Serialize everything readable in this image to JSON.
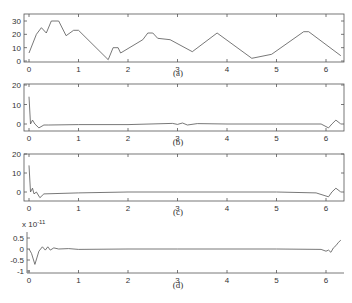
{
  "chart_data": [
    {
      "type": "line",
      "panel": "a",
      "caption": "(a)",
      "xlim": [
        0,
        6.3
      ],
      "ylim": [
        -2,
        35
      ],
      "xticks": [
        0,
        1,
        2,
        3,
        4,
        5,
        6
      ],
      "yticks": [
        0,
        10,
        20,
        30
      ],
      "x": [
        0,
        0.15,
        0.25,
        0.35,
        0.45,
        0.6,
        0.75,
        0.9,
        1.0,
        1.6,
        1.7,
        1.8,
        1.85,
        2.3,
        2.4,
        2.5,
        2.6,
        2.85,
        3.3,
        3.8,
        4.5,
        4.9,
        5.55,
        5.65,
        6.3
      ],
      "values": [
        6,
        20,
        25,
        21,
        30,
        30,
        19,
        23,
        23,
        1,
        10,
        10,
        6,
        16,
        21,
        21,
        17,
        16,
        7,
        21,
        2,
        5,
        22,
        22,
        4
      ],
      "grid": false,
      "box": true
    },
    {
      "type": "line",
      "panel": "b",
      "caption": "(b)",
      "xlim": [
        0,
        6.3
      ],
      "ylim": [
        -5,
        20
      ],
      "xticks": [
        0,
        1,
        2,
        3,
        4,
        5,
        6
      ],
      "yticks": [
        0,
        10,
        20
      ],
      "x": [
        0,
        0.03,
        0.07,
        0.12,
        0.2,
        0.3,
        0.4,
        1,
        2,
        2.9,
        3.0,
        3.1,
        3.2,
        3.4,
        4,
        5,
        5.9,
        6.05,
        6.12,
        6.2,
        6.3
      ],
      "values": [
        14,
        0,
        2,
        0,
        -2,
        -0.5,
        -0.5,
        -0.3,
        -0.3,
        0.3,
        -0.2,
        0.5,
        -0.5,
        0.2,
        0,
        0,
        0,
        -2,
        0,
        2,
        0
      ],
      "grid": false,
      "box": true
    },
    {
      "type": "line",
      "panel": "c",
      "caption": "(c)",
      "xlim": [
        0,
        6.3
      ],
      "ylim": [
        -5,
        20
      ],
      "xticks": [
        0,
        1,
        2,
        3,
        4,
        5,
        6
      ],
      "yticks": [
        0,
        10,
        20
      ],
      "x": [
        0,
        0.03,
        0.07,
        0.1,
        0.15,
        0.22,
        0.3,
        1,
        2,
        3,
        4,
        5,
        5.8,
        6.05,
        6.12,
        6.2,
        6.3
      ],
      "values": [
        14,
        0,
        2,
        -1,
        0,
        -3,
        -1,
        -0.5,
        0,
        0,
        0,
        0,
        -0.5,
        -2.5,
        0,
        2,
        0
      ],
      "grid": false,
      "box": true
    },
    {
      "type": "line",
      "panel": "d",
      "caption": "(d)",
      "y_multiplier": "x 10^-11",
      "xlim": [
        0,
        6.3
      ],
      "ylim": [
        -1,
        1
      ],
      "xticks": [
        0,
        1,
        2,
        3,
        4,
        5,
        6
      ],
      "yticks": [
        -1,
        -0.5,
        0,
        0.5
      ],
      "x": [
        0,
        0.05,
        0.12,
        0.2,
        0.27,
        0.33,
        0.38,
        0.43,
        0.5,
        0.6,
        0.8,
        1.0,
        2,
        3,
        4,
        5,
        5.9,
        6.0,
        6.05,
        6.1,
        6.15,
        6.2,
        6.25,
        6.3
      ],
      "values": [
        0,
        -0.2,
        -0.7,
        -0.1,
        0.1,
        -0.05,
        0.1,
        -0.05,
        0.05,
        0,
        0.02,
        -0.02,
        0,
        0,
        0,
        0,
        -0.02,
        -0.1,
        -0.05,
        -0.15,
        0.05,
        0.15,
        0.3,
        0.4
      ],
      "grid": false,
      "box": false
    }
  ],
  "labels": {
    "multiplier_text": "x 10",
    "multiplier_exp": "-11"
  }
}
